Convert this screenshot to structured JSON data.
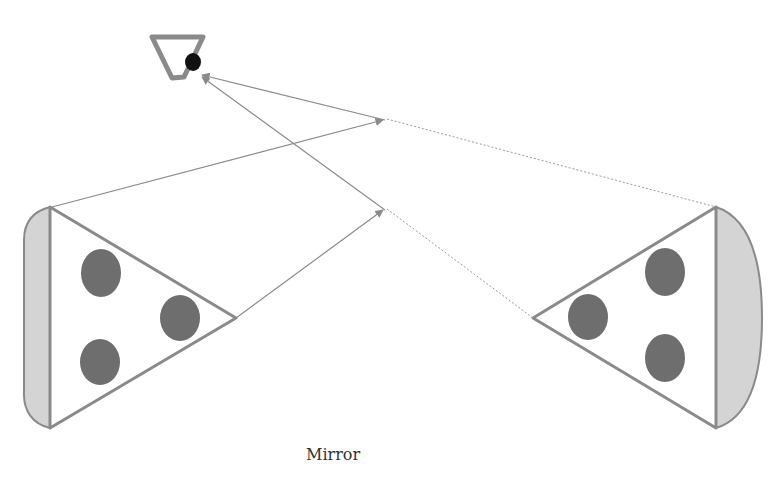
{
  "diagram": {
    "labels": {
      "mirror": "Mirror"
    },
    "colors": {
      "stroke": "#8a8a8a",
      "mirror": "#8c8c8c",
      "dot": "#6e6e6e",
      "shade": "#d4d4d4",
      "eye_pupil": "#111111"
    },
    "elements": {
      "eye": "eye-icon",
      "object": "cone-with-three-dots (left, real)",
      "image": "cone-with-three-dots (right, virtual image)",
      "mirror": "vertical mirror line",
      "rays": [
        "solid ray top",
        "solid ray bottom"
      ],
      "virtual_rays": [
        "dotted ray top",
        "dotted ray bottom"
      ]
    }
  }
}
